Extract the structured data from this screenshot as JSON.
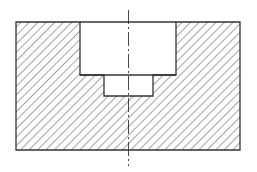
{
  "drawing": {
    "title": "Sectional view of stepped counterbored block",
    "colors": {
      "background": "#ffffff",
      "outline": "#333333",
      "hatch": "#555555",
      "centerline": "#333333"
    },
    "outer_block": {
      "x": 16,
      "y": 22,
      "width": 224,
      "height": 128
    },
    "counterbore": {
      "x": 80,
      "y": 22,
      "width": 96,
      "height": 53
    },
    "step_hole": {
      "x": 104,
      "y": 75,
      "width": 49,
      "height": 21
    },
    "centerline": {
      "x": 128.5,
      "y1": 10,
      "y2": 166,
      "dash": "14 3 2 3"
    },
    "hatch": {
      "angle_deg": -45,
      "spacing": 6
    }
  }
}
